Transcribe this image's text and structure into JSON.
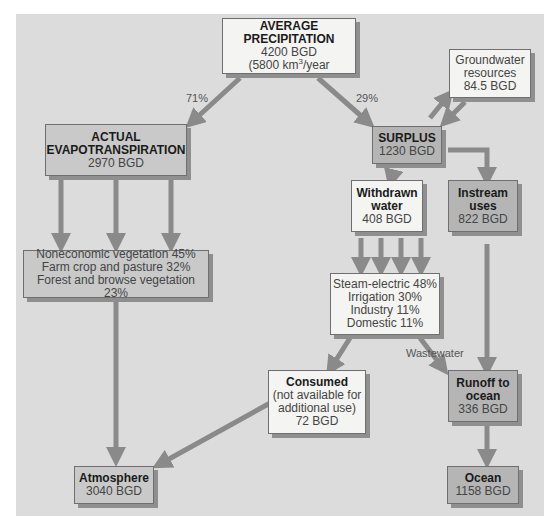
{
  "diagram": {
    "precipitation": {
      "title": "AVERAGE PRECIPITATION",
      "value": "4200 BGD",
      "sub_prefix": "(5800 km",
      "sub_sup": "3",
      "sub_suffix": "/year"
    },
    "evapotranspiration": {
      "title_line1": "ACTUAL",
      "title_line2": "EVAPOTRANSPIRATION",
      "value": "2970 BGD"
    },
    "surplus": {
      "title": "SURPLUS",
      "value": "1230 BGD"
    },
    "groundwater": {
      "line1": "Groundwater",
      "line2": "resources",
      "value": "84.5 BGD"
    },
    "withdrawn": {
      "title_line1": "Withdrawn",
      "title_line2": "water",
      "value": "408 BGD"
    },
    "instream": {
      "title_line1": "Instream",
      "title_line2": "uses",
      "value": "822 BGD"
    },
    "vegetation": {
      "line1": "Noneconomic vegetation 45%",
      "line2": "Farm crop and pasture 32%",
      "line3": "Forest and browse vegetation 23%"
    },
    "uses": {
      "line1": "Steam-electric 48%",
      "line2": "Irrigation 30%",
      "line3": "Industry 11%",
      "line4": "Domestic 11%"
    },
    "consumed": {
      "title": "Consumed",
      "line1": "(not available for",
      "line2": "additional use)",
      "value": "72 BGD"
    },
    "runoff": {
      "title_line1": "Runoff to",
      "title_line2": "ocean",
      "value": "336 BGD"
    },
    "atmosphere": {
      "title": "Atmosphere",
      "value": "3040 BGD"
    },
    "ocean": {
      "title": "Ocean",
      "value": "1158 BGD"
    },
    "labels": {
      "pct_evap": "71%",
      "pct_surplus": "29%",
      "wastewater": "Wastewater"
    },
    "colors": {
      "background": "#dcdcdc",
      "arrow": "#8a8a8a",
      "box_light": "#f4f4f2",
      "box_dark": "#b5b5b5"
    }
  }
}
